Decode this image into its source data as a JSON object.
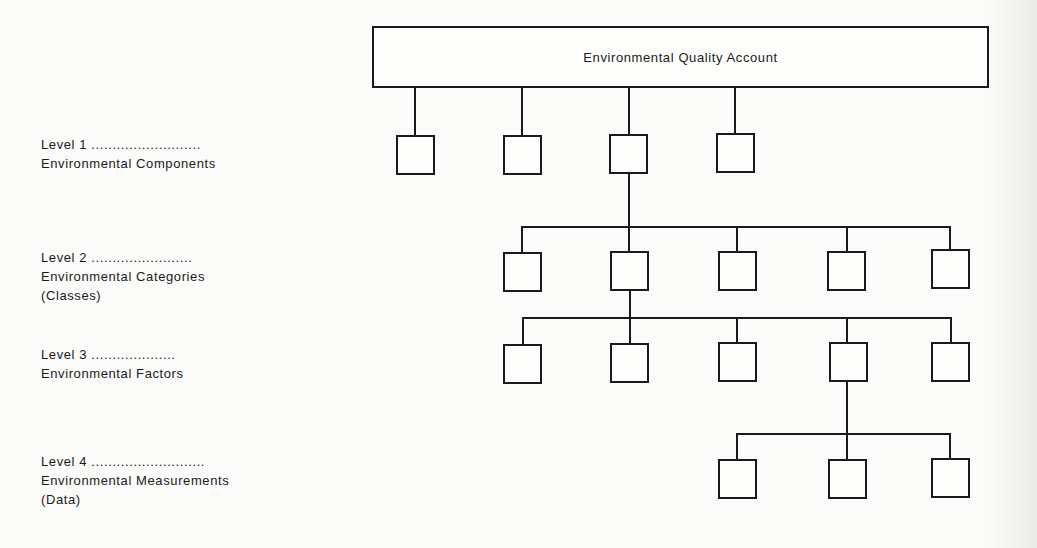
{
  "diagram": {
    "root": {
      "label": "Environmental Quality Account"
    },
    "levels": [
      {
        "level_label": "Level 1 ..........................",
        "lines": [
          "Environmental Components"
        ],
        "node_count": 4
      },
      {
        "level_label": "Level 2 ........................",
        "lines": [
          "Environmental Categories",
          "(Classes)"
        ],
        "node_count": 5
      },
      {
        "level_label": "Level 3 ....................",
        "lines": [
          "Environmental Factors"
        ],
        "node_count": 5
      },
      {
        "level_label": "Level 4 ...........................",
        "lines": [
          "Environmental Measurements",
          "(Data)"
        ],
        "node_count": 3
      }
    ],
    "expansion": {
      "level1_expanded_node": 3,
      "level2_expanded_node": 2,
      "level3_expanded_node": 4
    },
    "colors": {
      "line": "#1a1a1a",
      "background": "#fbfbf9"
    }
  }
}
